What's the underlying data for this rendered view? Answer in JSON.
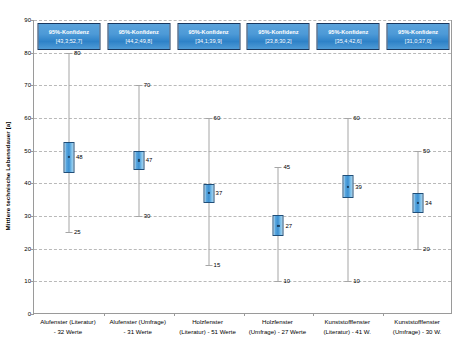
{
  "chart_data": {
    "type": "bar",
    "title": "",
    "subtitle": "",
    "xlabel": "",
    "ylabel": "Mittlere technische Lebensdauer [a]",
    "ylim": [
      0,
      90
    ],
    "ytick_step": 10,
    "yticks": [
      "0",
      "10",
      "20",
      "30",
      "40",
      "50",
      "60",
      "70",
      "80",
      "90"
    ],
    "grid": true,
    "legend": "none",
    "chart_style": "mean-with-95%-confidence-interval-box-and-min-max-whiskers",
    "categories": [
      "Alufenster (Literatur) - 32 Werte",
      "Alufenster (Umfrage) - 31 Werte",
      "Holzfenster (Literatur) - 51 Werte",
      "Holzfenster (Umfrage) - 27 Werte",
      "Kunststofffenster (Literatur) - 41 W.",
      "Kunststofffenster (Umfrage) - 30 W."
    ],
    "category_lines": [
      [
        "Alufenster (Literatur)",
        "- 32 Werte"
      ],
      [
        "Alufenster (Umfrage)",
        "- 31 Werte"
      ],
      [
        "Holzfenster",
        "(Literatur) - 51 Werte"
      ],
      [
        "Holzfenster",
        "(Umfrage) - 27 Werte"
      ],
      [
        "Kunststofffenster",
        "(Literatur) - 41 W."
      ],
      [
        "Kunststofffenster",
        "(Umfrage) - 30 W."
      ]
    ],
    "series": [
      {
        "name": "Mittelwert",
        "values": [
          48,
          47,
          37,
          27,
          39,
          34
        ]
      },
      {
        "name": "Maximum (oberer Whisker)",
        "values": [
          80,
          70,
          60,
          45,
          60,
          50
        ]
      },
      {
        "name": "Minimum (unterer Whisker)",
        "values": [
          25,
          30,
          15,
          10,
          10,
          20
        ]
      },
      {
        "name": "95%-Konfidenz untere Grenze",
        "values": [
          43.3,
          44.2,
          34.1,
          23.8,
          35.4,
          31.0
        ]
      },
      {
        "name": "95%-Konfidenz obere Grenze",
        "values": [
          52.7,
          49.8,
          39.9,
          30.2,
          42.6,
          37.0
        ]
      }
    ],
    "mean_labels": [
      "48",
      "47",
      "37",
      "27",
      "39",
      "34"
    ],
    "max_labels": [
      "80",
      "70",
      "60",
      "45",
      "60",
      "50"
    ],
    "min_labels": [
      "25",
      "30",
      "15",
      "10",
      "10",
      "20"
    ],
    "confidence_boxes": [
      {
        "title": "95%-Konfidenz",
        "interval": "[43,3;52,7]"
      },
      {
        "title": "95%-Konfidenz",
        "interval": "[44,2;49,8]"
      },
      {
        "title": "95%-Konfidenz",
        "interval": "[34,1;39,9]"
      },
      {
        "title": "95%-Konfidenz",
        "interval": "[23,8;30,2]"
      },
      {
        "title": "95%-Konfidenz",
        "interval": "[35,4;42,6]"
      },
      {
        "title": "95%-Konfidenz",
        "interval": "[31,0;37,0]"
      }
    ],
    "colors": {
      "box_fill": "#3b8fd1",
      "box_border": "#1f4e79",
      "callout_fill": "#2e82c8",
      "callout_border": "#17375e",
      "whisker": "#a6a6a6",
      "gridline": "#b9b9b9",
      "axis": "#9a9a9a",
      "text": "#000000"
    }
  }
}
